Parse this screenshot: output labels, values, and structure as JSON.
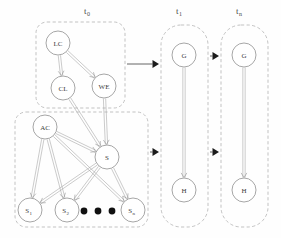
{
  "figure": {
    "type": "dynamic-bayesian-network",
    "background_color": "#fefefe",
    "node_stroke_color": "#8f8f8f",
    "edge_color": "#a0a0a0",
    "group_box_color": "#b4b4b4",
    "transition_arrow_color": "#1c1c1c"
  },
  "time_slices": [
    {
      "id": "t0",
      "label": "t",
      "subscript": "0",
      "x": 84,
      "y": 14
    },
    {
      "id": "t1",
      "label": "t",
      "subscript": "1",
      "x": 176,
      "y": 14
    },
    {
      "id": "tn",
      "label": "t",
      "subscript": "n",
      "x": 236,
      "y": 14
    }
  ],
  "group_boxes": [
    {
      "id": "box-t0-upper",
      "x": 36,
      "y": 22,
      "width": 89,
      "height": 86,
      "rx": 11
    },
    {
      "id": "box-t0-lower",
      "x": 15,
      "y": 112,
      "width": 133,
      "height": 115,
      "rx": 11
    },
    {
      "id": "box-t1",
      "x": 161,
      "y": 25,
      "width": 47,
      "height": 202,
      "rx": 20
    },
    {
      "id": "box-tn",
      "x": 221,
      "y": 25,
      "width": 47,
      "height": 202,
      "rx": 20
    }
  ],
  "nodes": [
    {
      "id": "LC",
      "label": "LC",
      "sub": "",
      "cx": 58,
      "cy": 43,
      "r": 12
    },
    {
      "id": "CL",
      "label": "CL",
      "sub": "",
      "cx": 63,
      "cy": 88,
      "r": 12
    },
    {
      "id": "WE",
      "label": "WE",
      "sub": "",
      "cx": 104,
      "cy": 86,
      "r": 12
    },
    {
      "id": "AC",
      "label": "AC",
      "sub": "",
      "cx": 45,
      "cy": 127,
      "r": 12
    },
    {
      "id": "S",
      "label": "S",
      "sub": "",
      "cx": 107,
      "cy": 157,
      "r": 12
    },
    {
      "id": "S1",
      "label": "S",
      "sub": "1",
      "cx": 30,
      "cy": 210,
      "r": 12
    },
    {
      "id": "S2",
      "label": "S",
      "sub": "2",
      "cx": 67,
      "cy": 210,
      "r": 12
    },
    {
      "id": "Sn",
      "label": "S",
      "sub": "n",
      "cx": 133,
      "cy": 210,
      "r": 12
    },
    {
      "id": "G1",
      "label": "G",
      "sub": "",
      "cx": 184,
      "cy": 55,
      "r": 12
    },
    {
      "id": "H1",
      "label": "H",
      "sub": "",
      "cx": 184,
      "cy": 190,
      "r": 12
    },
    {
      "id": "G2",
      "label": "G",
      "sub": "",
      "cx": 244,
      "cy": 55,
      "r": 12
    },
    {
      "id": "H2",
      "label": "H",
      "sub": "",
      "cx": 244,
      "cy": 190,
      "r": 12
    }
  ],
  "edges": [
    {
      "from": "LC",
      "to": "CL"
    },
    {
      "from": "LC",
      "to": "WE"
    },
    {
      "from": "CL",
      "to": "S"
    },
    {
      "from": "WE",
      "to": "S"
    },
    {
      "from": "AC",
      "to": "S"
    },
    {
      "from": "AC",
      "to": "S1"
    },
    {
      "from": "AC",
      "to": "S2"
    },
    {
      "from": "AC",
      "to": "Sn"
    },
    {
      "from": "S",
      "to": "S1"
    },
    {
      "from": "S",
      "to": "S2"
    },
    {
      "from": "S",
      "to": "Sn"
    },
    {
      "from": "G1",
      "to": "H1"
    },
    {
      "from": "G2",
      "to": "H2"
    }
  ],
  "transition_arrows": [
    {
      "id": "t0-upper-to-t1-g",
      "x1": 127,
      "y1": 64,
      "x2": 159,
      "y2": 64
    },
    {
      "id": "t0-lower-to-t1-h",
      "x1": 150,
      "y1": 152,
      "x2": 159,
      "y2": 152
    },
    {
      "id": "t1-to-tn-g",
      "x1": 210,
      "y1": 56,
      "x2": 219,
      "y2": 56
    },
    {
      "id": "t1-to-tn-h",
      "x1": 210,
      "y1": 152,
      "x2": 219,
      "y2": 152
    }
  ],
  "ellipsis": {
    "id": "ellipsis-dots",
    "dots": [
      {
        "cx": 84,
        "cy": 211
      },
      {
        "cx": 98,
        "cy": 211
      },
      {
        "cx": 112,
        "cy": 211
      }
    ],
    "r": 3.4
  }
}
